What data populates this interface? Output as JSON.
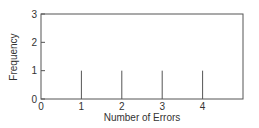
{
  "chart_data": {
    "type": "bar",
    "title": "",
    "xlabel": "Number of Errors",
    "ylabel": "Frequency",
    "categories": [
      "1",
      "2",
      "3",
      "4"
    ],
    "x": [
      1,
      2,
      3,
      4
    ],
    "values": [
      1,
      1,
      1,
      1
    ],
    "xlim": [
      0,
      5
    ],
    "ylim": [
      0,
      3
    ],
    "x_ticks": [
      "0",
      "1",
      "2",
      "3",
      "4"
    ],
    "y_ticks": [
      "0",
      "1",
      "2",
      "3"
    ],
    "grid": false,
    "legend": null,
    "style": "spike/line bars inside boxed axes"
  }
}
